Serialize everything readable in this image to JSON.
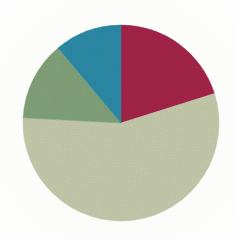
{
  "figure": {
    "background_color": "#fdfdfb",
    "width": 236,
    "height": 239
  },
  "chart_data": {
    "type": "pie",
    "title": "",
    "subtitle": "",
    "xlabel": "",
    "ylabel": "",
    "grid": false,
    "legend": "none",
    "labels_shown": false,
    "start_angle_deg": 0,
    "direction": "clockwise",
    "center": {
      "cx": 121,
      "cy": 123
    },
    "radius": 98,
    "categories": [
      "Segment 1",
      "Segment 2",
      "Segment 3",
      "Segment 4"
    ],
    "values": [
      20.1,
      55.7,
      13.1,
      11.1
    ],
    "units": "percent",
    "angles_deg": [
      72.5,
      200.5,
      47.0,
      40.0
    ],
    "colors": [
      "#a32348",
      "#c4c9ab",
      "#80a178",
      "#2b8aa6"
    ],
    "slices": [
      {
        "name": "Segment 1",
        "color": "#a32348",
        "color_name": "crimson",
        "value": 20.1,
        "angle_deg": 72.5,
        "start_deg": 0,
        "end_deg": 72.5,
        "position": "upper-right"
      },
      {
        "name": "Segment 2",
        "color": "#c4c9ab",
        "color_name": "pale-sage",
        "value": 55.7,
        "angle_deg": 200.5,
        "start_deg": 72.5,
        "end_deg": 273.0,
        "position": "bottom"
      },
      {
        "name": "Segment 3",
        "color": "#80a178",
        "color_name": "medium-green",
        "value": 13.1,
        "angle_deg": 47.0,
        "start_deg": 273.0,
        "end_deg": 320.0,
        "position": "upper-left"
      },
      {
        "name": "Segment 4",
        "color": "#2b8aa6",
        "color_name": "teal",
        "value": 11.1,
        "angle_deg": 40.0,
        "start_deg": 320.0,
        "end_deg": 360.0,
        "position": "top-left-of-vertical"
      }
    ]
  }
}
